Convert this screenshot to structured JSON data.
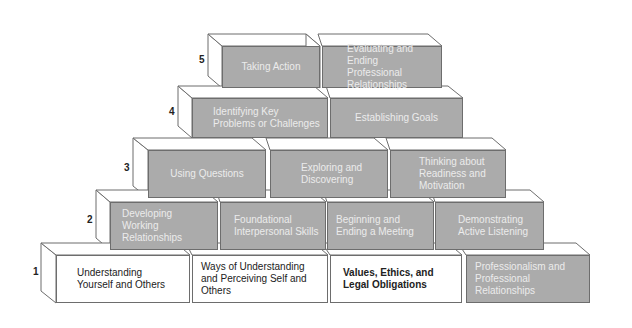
{
  "diagram": {
    "type": "pyramid",
    "rows": [
      {
        "number": "5",
        "blocks": [
          {
            "label": "Taking Action",
            "fill": "gray"
          },
          {
            "label": "Evaluating and Ending Professional Relationships",
            "fill": "gray"
          }
        ]
      },
      {
        "number": "4",
        "blocks": [
          {
            "label": "Identifying Key Problems or Challenges",
            "fill": "gray"
          },
          {
            "label": "Establishing Goals",
            "fill": "gray"
          }
        ]
      },
      {
        "number": "3",
        "blocks": [
          {
            "label": "Using Questions",
            "fill": "gray"
          },
          {
            "label": "Exploring and Discovering",
            "fill": "gray"
          },
          {
            "label": "Thinking about Readiness and Motivation",
            "fill": "gray"
          }
        ]
      },
      {
        "number": "2",
        "blocks": [
          {
            "label": "Developing Working Relationships",
            "fill": "gray"
          },
          {
            "label": "Foundational Interpersonal Skills",
            "fill": "gray"
          },
          {
            "label": "Beginning and Ending a Meeting",
            "fill": "gray"
          },
          {
            "label": "Demonstrating Active Listening",
            "fill": "gray"
          }
        ]
      },
      {
        "number": "1",
        "blocks": [
          {
            "label": "Understanding Yourself and Others",
            "fill": "white"
          },
          {
            "label": "Ways of Understanding and Perceiving Self and Others",
            "fill": "white"
          },
          {
            "label": "Values, Ethics, and Legal Obligations",
            "fill": "white",
            "bold": true
          },
          {
            "label": "Professionalism and Professional Relationships",
            "fill": "gray"
          }
        ]
      }
    ],
    "colors": {
      "gray_face": "#ababab",
      "gray_top": "#c4c4c4",
      "white_face": "#ffffff",
      "outline": "#6d6d6d",
      "gray_text": "#ececec",
      "white_text": "#222222"
    }
  }
}
